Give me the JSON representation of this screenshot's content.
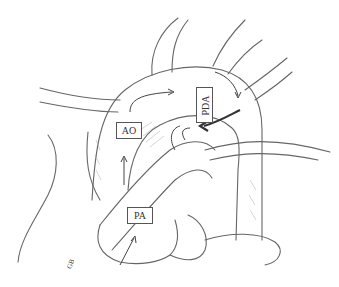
{
  "diagram": {
    "type": "anatomical-illustration",
    "labels": {
      "aorta": "AO",
      "pulmonary_artery": "PA",
      "ductus": "PDA"
    },
    "signature": "GB",
    "colors": {
      "background": "#ffffff",
      "line": "#555555",
      "shading": "#999999"
    }
  }
}
